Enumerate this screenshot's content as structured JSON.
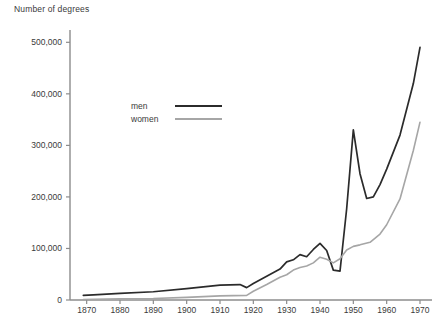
{
  "chart_data": {
    "type": "line",
    "title": "",
    "ylabel": "Number of degrees",
    "xlabel": "",
    "xlim": [
      1865,
      1973
    ],
    "ylim": [
      0,
      520000
    ],
    "grid": false,
    "legend_position": "inside-upper-left",
    "yticks": [
      0,
      100000,
      200000,
      300000,
      400000,
      500000
    ],
    "ytick_labels": [
      "0",
      "100,000",
      "200,000",
      "300,000",
      "400,000",
      "500,000"
    ],
    "xticks": [
      1870,
      1880,
      1890,
      1900,
      1910,
      1920,
      1930,
      1940,
      1950,
      1960,
      1970
    ],
    "xtick_labels": [
      "1870",
      "1880",
      "1890",
      "1900",
      "1910",
      "1920",
      "1930",
      "1940",
      "1950",
      "1960",
      "1970"
    ],
    "series": [
      {
        "name": "men",
        "color": "#2b2b2b",
        "x": [
          1869,
          1872,
          1880,
          1890,
          1900,
          1910,
          1916,
          1918,
          1920,
          1924,
          1928,
          1930,
          1932,
          1934,
          1936,
          1938,
          1940,
          1942,
          1944,
          1946,
          1948,
          1950,
          1952,
          1954,
          1956,
          1958,
          1960,
          1964,
          1968,
          1970
        ],
        "y": [
          9000,
          10000,
          13000,
          16000,
          22000,
          29000,
          30000,
          24000,
          32000,
          46000,
          60000,
          74000,
          78000,
          88000,
          84000,
          98000,
          110000,
          96000,
          58000,
          56000,
          177000,
          330000,
          245000,
          197000,
          200000,
          224000,
          254000,
          320000,
          420000,
          490000
        ]
      },
      {
        "name": "women",
        "color": "#a6a6a6",
        "x": [
          1869,
          1872,
          1880,
          1890,
          1900,
          1910,
          1918,
          1920,
          1924,
          1928,
          1930,
          1932,
          1934,
          1936,
          1938,
          1940,
          1942,
          1944,
          1946,
          1948,
          1950,
          1952,
          1955,
          1958,
          1960,
          1964,
          1968,
          1970
        ],
        "y": [
          1000,
          1500,
          2500,
          3000,
          5000,
          8000,
          9000,
          17000,
          30000,
          44000,
          49000,
          58000,
          63000,
          66000,
          72000,
          83000,
          79000,
          72000,
          80000,
          97000,
          104000,
          107000,
          112000,
          128000,
          146000,
          196000,
          290000,
          345000
        ]
      }
    ],
    "annotations": []
  },
  "legend": {
    "items": [
      {
        "label": "men"
      },
      {
        "label": "women"
      }
    ]
  },
  "colors": {
    "men": "#2b2b2b",
    "women": "#a6a6a6",
    "axis": "#8c8c8c",
    "text": "#3a3a3a",
    "background": "#ffffff"
  }
}
